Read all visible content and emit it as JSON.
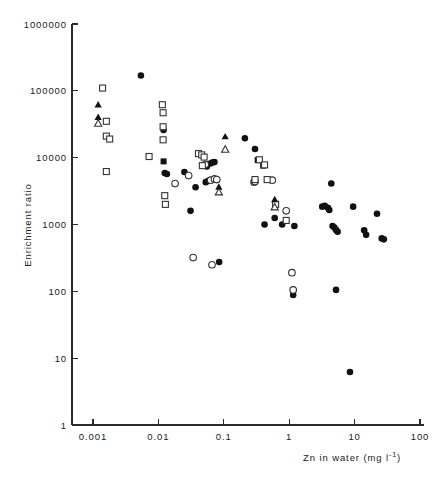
{
  "figure": {
    "background": "#ffffff",
    "ink_color": "#111111"
  },
  "chart_data": {
    "type": "scatter",
    "title": "",
    "subtitle": "",
    "xlabel": "Zn in water  (mg l",
    "xlabel_sup": "-1",
    "xlabel_tail": ")",
    "xlabel_full": "Zn in water (mg l-1)",
    "ylabel": "Enrichment ratio",
    "xscale": "log",
    "yscale": "log",
    "xlim": [
      0.001,
      100
    ],
    "ylim": [
      1,
      1000000
    ],
    "grid": false,
    "legend": "none",
    "xticks": [
      0.001,
      0.01,
      0.1,
      1,
      10,
      100
    ],
    "xtick_labels": [
      "0.001",
      "0.01",
      "0.1",
      "1",
      "10",
      "100"
    ],
    "yticks": [
      1,
      10,
      100,
      1000,
      10000,
      100000,
      1000000
    ],
    "ytick_labels": [
      "1",
      "10",
      "100",
      "1000",
      "10000",
      "100000",
      "1000000"
    ],
    "series": [
      {
        "name": "filled-circle",
        "marker": "filled-circle",
        "points": [
          [
            0.0054,
            170000
          ],
          [
            0.012,
            26000
          ],
          [
            0.0125,
            5900
          ],
          [
            0.0135,
            5700
          ],
          [
            0.025,
            6100
          ],
          [
            0.031,
            1600
          ],
          [
            0.037,
            3600
          ],
          [
            0.055,
            7400
          ],
          [
            0.062,
            8200
          ],
          [
            0.068,
            8500
          ],
          [
            0.072,
            8600
          ],
          [
            0.058,
            4500
          ],
          [
            0.053,
            4300
          ],
          [
            0.085,
            275
          ],
          [
            0.21,
            19500
          ],
          [
            0.3,
            13500
          ],
          [
            0.42,
            1000
          ],
          [
            0.6,
            1250
          ],
          [
            0.78,
            1000
          ],
          [
            1.15,
            88
          ],
          [
            1.2,
            950
          ],
          [
            3.2,
            1850
          ],
          [
            3.5,
            1900
          ],
          [
            3.9,
            1780
          ],
          [
            4.1,
            1650
          ],
          [
            4.4,
            4100
          ],
          [
            4.6,
            950
          ],
          [
            4.9,
            900
          ],
          [
            5.2,
            830
          ],
          [
            5.5,
            780
          ],
          [
            5.2,
            105
          ],
          [
            8.5,
            6.2
          ],
          [
            9.5,
            1850
          ],
          [
            14,
            820
          ],
          [
            15,
            700
          ],
          [
            22,
            1450
          ],
          [
            26,
            620
          ],
          [
            28,
            600
          ]
        ]
      },
      {
        "name": "open-circle",
        "marker": "open-circle",
        "points": [
          [
            0.018,
            4100
          ],
          [
            0.029,
            5400
          ],
          [
            0.034,
            320
          ],
          [
            0.052,
            7900
          ],
          [
            0.063,
            4600
          ],
          [
            0.072,
            4800
          ],
          [
            0.078,
            4700
          ],
          [
            0.066,
            250
          ],
          [
            0.29,
            4300
          ],
          [
            0.3,
            4400
          ],
          [
            0.55,
            4600
          ],
          [
            0.9,
            1600
          ],
          [
            1.1,
            190
          ],
          [
            1.15,
            105
          ]
        ]
      },
      {
        "name": "filled-square",
        "marker": "filled-square",
        "points": [
          [
            0.012,
            8800
          ],
          [
            0.33,
            9200
          ],
          [
            0.4,
            7600
          ]
        ]
      },
      {
        "name": "open-square",
        "marker": "open-square",
        "points": [
          [
            0.0014,
            110000
          ],
          [
            0.0016,
            35000
          ],
          [
            0.0016,
            21000
          ],
          [
            0.0018,
            19000
          ],
          [
            0.0016,
            6200
          ],
          [
            0.0115,
            62000
          ],
          [
            0.0118,
            47000
          ],
          [
            0.0118,
            29000
          ],
          [
            0.0118,
            18500
          ],
          [
            0.0072,
            10400
          ],
          [
            0.0125,
            2700
          ],
          [
            0.0128,
            2000
          ],
          [
            0.041,
            11500
          ],
          [
            0.046,
            11000
          ],
          [
            0.05,
            10200
          ],
          [
            0.047,
            7600
          ],
          [
            0.35,
            9300
          ],
          [
            0.42,
            7800
          ],
          [
            0.3,
            4700
          ],
          [
            0.46,
            4700
          ],
          [
            0.62,
            2000
          ],
          [
            0.9,
            1150
          ]
        ]
      },
      {
        "name": "filled-triangle",
        "marker": "filled-triangle",
        "points": [
          [
            0.0012,
            63000
          ],
          [
            0.0012,
            41000
          ],
          [
            0.105,
            21000
          ],
          [
            0.084,
            3700
          ],
          [
            0.6,
            2400
          ]
        ]
      },
      {
        "name": "open-triangle",
        "marker": "open-triangle",
        "points": [
          [
            0.0012,
            33000
          ],
          [
            0.105,
            13500
          ],
          [
            0.084,
            3100
          ],
          [
            0.6,
            1850
          ]
        ]
      }
    ]
  }
}
